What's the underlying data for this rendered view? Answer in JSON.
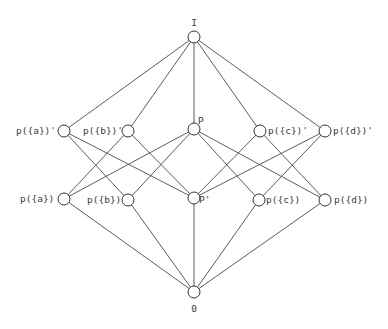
{
  "diagram": {
    "type": "hasse-diagram",
    "nodes": [
      {
        "id": "I",
        "label": "I",
        "x": 194,
        "y": 37,
        "lx": 194,
        "ly": 26,
        "anchor": "middle"
      },
      {
        "id": "ap",
        "label": "p({a})'",
        "x": 64,
        "y": 131,
        "lx": 16,
        "ly": 134,
        "anchor": "start"
      },
      {
        "id": "bp",
        "label": "p({b})'",
        "x": 128,
        "y": 131,
        "lx": 83,
        "ly": 134,
        "anchor": "start"
      },
      {
        "id": "P",
        "label": "P",
        "x": 194,
        "y": 129,
        "lx": 198,
        "ly": 124,
        "anchor": "start"
      },
      {
        "id": "cp",
        "label": "p({c})'",
        "x": 260,
        "y": 131,
        "lx": 268,
        "ly": 134,
        "anchor": "start"
      },
      {
        "id": "dp",
        "label": "p({d})'",
        "x": 325,
        "y": 131,
        "lx": 333,
        "ly": 134,
        "anchor": "start"
      },
      {
        "id": "a",
        "label": "p({a})",
        "x": 64,
        "y": 199,
        "lx": 20,
        "ly": 202,
        "anchor": "start"
      },
      {
        "id": "b",
        "label": "p({b})",
        "x": 128,
        "y": 200,
        "lx": 87,
        "ly": 203,
        "anchor": "start"
      },
      {
        "id": "Pp",
        "label": "P'",
        "x": 194,
        "y": 198,
        "lx": 199,
        "ly": 203,
        "anchor": "start"
      },
      {
        "id": "c",
        "label": "p({c})",
        "x": 259,
        "y": 200,
        "lx": 266,
        "ly": 203,
        "anchor": "start"
      },
      {
        "id": "d",
        "label": "p({d})",
        "x": 325,
        "y": 200,
        "lx": 334,
        "ly": 203,
        "anchor": "start"
      },
      {
        "id": "O",
        "label": "0",
        "x": 194,
        "y": 292,
        "lx": 194,
        "ly": 312,
        "anchor": "middle"
      }
    ],
    "edges": [
      [
        "I",
        "ap"
      ],
      [
        "I",
        "bp"
      ],
      [
        "I",
        "P"
      ],
      [
        "I",
        "cp"
      ],
      [
        "I",
        "dp"
      ],
      [
        "ap",
        "b"
      ],
      [
        "ap",
        "Pp"
      ],
      [
        "bp",
        "a"
      ],
      [
        "bp",
        "Pp"
      ],
      [
        "cp",
        "d"
      ],
      [
        "cp",
        "Pp"
      ],
      [
        "dp",
        "c"
      ],
      [
        "dp",
        "Pp"
      ],
      [
        "P",
        "a"
      ],
      [
        "P",
        "b"
      ],
      [
        "P",
        "c"
      ],
      [
        "P",
        "d"
      ],
      [
        "a",
        "O"
      ],
      [
        "b",
        "O"
      ],
      [
        "Pp",
        "O"
      ],
      [
        "c",
        "O"
      ],
      [
        "d",
        "O"
      ]
    ],
    "node_radius": 6
  }
}
